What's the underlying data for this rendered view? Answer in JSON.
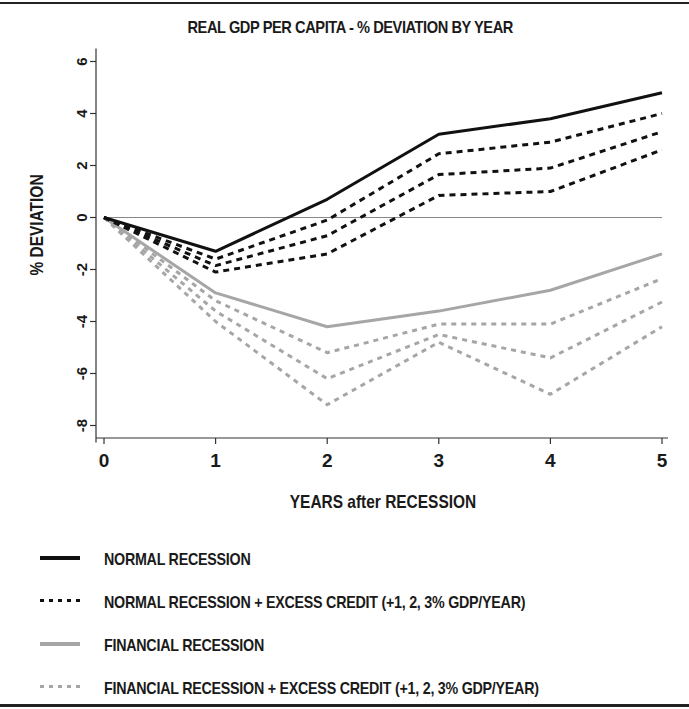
{
  "chart_data": {
    "type": "line",
    "title": "REAL GDP PER CAPITA - % DEVIATION BY YEAR",
    "xlabel": "YEARS after RECESSION",
    "ylabel": "% DEVIATION",
    "x": [
      0,
      1,
      2,
      3,
      4,
      5
    ],
    "x_ticks": [
      "0",
      "1",
      "2",
      "3",
      "4",
      "5"
    ],
    "y_ticks": [
      "6",
      "4",
      "2",
      "0",
      "-2",
      "-4",
      "-6",
      "-8"
    ],
    "y_tick_values": [
      6,
      4,
      2,
      0,
      -2,
      -4,
      -6,
      -8
    ],
    "ylim": [
      -8.5,
      6.5
    ],
    "xlim": [
      0,
      5
    ],
    "grid": false,
    "reference_line": 0,
    "legend_position": "bottom",
    "series": [
      {
        "name": "NORMAL RECESSION",
        "style": "solid",
        "color": "#111111",
        "values": [
          0,
          -1.3,
          0.7,
          3.2,
          3.8,
          4.8
        ]
      },
      {
        "name": "NORMAL RECESSION + EXCESS CREDIT (+1% GDP/YEAR)",
        "style": "dashed",
        "color": "#111111",
        "values": [
          0,
          -1.6,
          -0.1,
          2.45,
          2.9,
          4.0
        ]
      },
      {
        "name": "NORMAL RECESSION + EXCESS CREDIT (+2% GDP/YEAR)",
        "style": "dashed",
        "color": "#111111",
        "values": [
          0,
          -1.85,
          -0.7,
          1.65,
          1.9,
          3.3
        ]
      },
      {
        "name": "NORMAL RECESSION + EXCESS CREDIT (+3% GDP/YEAR)",
        "style": "dashed",
        "color": "#111111",
        "values": [
          0,
          -2.1,
          -1.4,
          0.85,
          1.0,
          2.6
        ]
      },
      {
        "name": "FINANCIAL RECESSION",
        "style": "solid",
        "color": "#a6a6a6",
        "values": [
          0,
          -2.9,
          -4.2,
          -3.6,
          -2.8,
          -1.4
        ]
      },
      {
        "name": "FINANCIAL RECESSION + EXCESS CREDIT (+1% GDP/YEAR)",
        "style": "dashed",
        "color": "#a6a6a6",
        "values": [
          0,
          -3.2,
          -5.2,
          -4.1,
          -4.1,
          -2.35
        ]
      },
      {
        "name": "FINANCIAL RECESSION + EXCESS CREDIT (+2% GDP/YEAR)",
        "style": "dashed",
        "color": "#a6a6a6",
        "values": [
          0,
          -3.6,
          -6.2,
          -4.5,
          -5.4,
          -3.25
        ]
      },
      {
        "name": "FINANCIAL RECESSION + EXCESS CREDIT (+3% GDP/YEAR)",
        "style": "dashed",
        "color": "#a6a6a6",
        "values": [
          0,
          -4.0,
          -7.2,
          -4.8,
          -6.8,
          -4.2
        ]
      }
    ]
  },
  "legend": {
    "items": [
      {
        "label": "NORMAL RECESSION",
        "style": "solid",
        "color": "#111111"
      },
      {
        "label": "NORMAL RECESSION + EXCESS CREDIT (+1, 2, 3% GDP/YEAR)",
        "style": "dotted",
        "color": "#111111"
      },
      {
        "label": "FINANCIAL RECESSION",
        "style": "solid",
        "color": "#a6a6a6"
      },
      {
        "label": "FINANCIAL RECESSION + EXCESS CREDIT (+1, 2, 3% GDP/YEAR)",
        "style": "dotted",
        "color": "#a6a6a6"
      }
    ]
  }
}
